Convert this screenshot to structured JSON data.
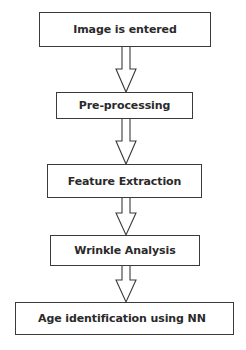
{
  "diagram": {
    "type": "flowchart",
    "direction": "top-to-bottom",
    "nodes": [
      {
        "id": "n1",
        "label": "Image is entered"
      },
      {
        "id": "n2",
        "label": "Pre-processing"
      },
      {
        "id": "n3",
        "label": "Feature Extraction"
      },
      {
        "id": "n4",
        "label": "Wrinkle Analysis"
      },
      {
        "id": "n5",
        "label": "Age identification using NN"
      }
    ],
    "edges": [
      {
        "from": "n1",
        "to": "n2"
      },
      {
        "from": "n2",
        "to": "n3"
      },
      {
        "from": "n3",
        "to": "n4"
      },
      {
        "from": "n4",
        "to": "n5"
      }
    ],
    "colors": {
      "stroke": "#3a3a3a",
      "text": "#2a2a2a",
      "background": "#ffffff"
    }
  }
}
